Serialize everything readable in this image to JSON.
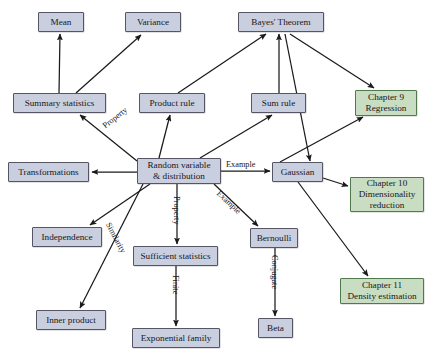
{
  "diagram": {
    "colors": {
      "concept_fill": "#c9cfdf",
      "concept_border": "#555566",
      "chapter_fill": "#c9ddc2",
      "chapter_border": "#4e7a4c",
      "edge": "#1a1a1a",
      "background": "#ffffff"
    },
    "nodes": [
      {
        "id": "mean",
        "label": "Mean",
        "type": "concept",
        "x": 38,
        "y": 12,
        "w": 46,
        "h": 20
      },
      {
        "id": "variance",
        "label": "Variance",
        "type": "concept",
        "x": 125,
        "y": 12,
        "w": 56,
        "h": 20
      },
      {
        "id": "bayes",
        "label": "Bayes' Theorem",
        "type": "concept",
        "x": 238,
        "y": 12,
        "w": 86,
        "h": 20
      },
      {
        "id": "summary_statistics",
        "label": "Summary statistics",
        "type": "concept",
        "x": 13,
        "y": 93,
        "w": 93,
        "h": 20
      },
      {
        "id": "product_rule",
        "label": "Product rule",
        "type": "concept",
        "x": 139,
        "y": 93,
        "w": 66,
        "h": 20
      },
      {
        "id": "sum_rule",
        "label": "Sum rule",
        "type": "concept",
        "x": 251,
        "y": 93,
        "w": 55,
        "h": 20
      },
      {
        "id": "chapter9",
        "label": "Chapter 9\nRegression",
        "type": "chapter",
        "x": 355,
        "y": 90,
        "w": 62,
        "h": 26
      },
      {
        "id": "transformations",
        "label": "Transformations",
        "type": "concept",
        "x": 8,
        "y": 162,
        "w": 81,
        "h": 20
      },
      {
        "id": "random_variable",
        "label": "Random variable\n& distribution",
        "type": "concept",
        "x": 137,
        "y": 158,
        "w": 84,
        "h": 26
      },
      {
        "id": "gaussian",
        "label": "Gaussian",
        "type": "concept",
        "x": 272,
        "y": 162,
        "w": 51,
        "h": 20
      },
      {
        "id": "chapter10",
        "label": "Chapter 10\nDimensionality\nreduction",
        "type": "chapter",
        "x": 350,
        "y": 177,
        "w": 74,
        "h": 35
      },
      {
        "id": "independence",
        "label": "Independence",
        "type": "concept",
        "x": 32,
        "y": 227,
        "w": 70,
        "h": 20
      },
      {
        "id": "sufficient_stats",
        "label": "Sufficient statistics",
        "type": "concept",
        "x": 133,
        "y": 246,
        "w": 85,
        "h": 20
      },
      {
        "id": "bernoulli",
        "label": "Bernoulli",
        "type": "concept",
        "x": 250,
        "y": 228,
        "w": 48,
        "h": 20
      },
      {
        "id": "chapter11",
        "label": "Chapter 11\nDensity estimation",
        "type": "chapter",
        "x": 340,
        "y": 278,
        "w": 84,
        "h": 26
      },
      {
        "id": "inner_product",
        "label": "Inner product",
        "type": "concept",
        "x": 36,
        "y": 310,
        "w": 70,
        "h": 20
      },
      {
        "id": "beta",
        "label": "Beta",
        "type": "concept",
        "x": 258,
        "y": 318,
        "w": 35,
        "h": 20
      },
      {
        "id": "exponential_family",
        "label": "Exponential family",
        "type": "concept",
        "x": 132,
        "y": 328,
        "w": 88,
        "h": 20
      }
    ],
    "edges": [
      {
        "id": "summary-to-mean",
        "from": "summary_statistics",
        "to": "mean",
        "x1": 59,
        "y1": 93,
        "x2": 60,
        "y2": 34,
        "label": ""
      },
      {
        "id": "summary-to-variance",
        "from": "summary_statistics",
        "to": "variance",
        "x1": 76,
        "y1": 93,
        "x2": 141,
        "y2": 35,
        "label": ""
      },
      {
        "id": "rv-to-summary",
        "from": "random_variable",
        "to": "summary_statistics",
        "x1": 137,
        "y1": 161,
        "x2": 80,
        "y2": 115,
        "label": "Property"
      },
      {
        "id": "rv-to-product-rule",
        "from": "random_variable",
        "to": "product_rule",
        "x1": 159,
        "y1": 158,
        "x2": 170,
        "y2": 115,
        "label": ""
      },
      {
        "id": "rv-to-sum-rule",
        "from": "random_variable",
        "to": "sum_rule",
        "x1": 200,
        "y1": 158,
        "x2": 272,
        "y2": 115,
        "label": ""
      },
      {
        "id": "product-rule-to-bayes",
        "from": "product_rule",
        "to": "bayes",
        "x1": 178,
        "y1": 93,
        "x2": 266,
        "y2": 34,
        "label": ""
      },
      {
        "id": "sum-rule-to-bayes",
        "from": "sum_rule",
        "to": "bayes",
        "x1": 279,
        "y1": 93,
        "x2": 279,
        "y2": 34,
        "label": ""
      },
      {
        "id": "bayes-to-chapter9",
        "from": "bayes",
        "to": "chapter9",
        "x1": 290,
        "y1": 34,
        "x2": 374,
        "y2": 88,
        "label": ""
      },
      {
        "id": "bayes-to-gaussian",
        "from": "bayes",
        "to": "gaussian",
        "x1": 285,
        "y1": 34,
        "x2": 310,
        "y2": 161,
        "label": ""
      },
      {
        "id": "rv-to-transformations",
        "from": "random_variable",
        "to": "transformations",
        "x1": 137,
        "y1": 172,
        "x2": 92,
        "y2": 172,
        "label": ""
      },
      {
        "id": "rv-to-gaussian",
        "from": "random_variable",
        "to": "gaussian",
        "x1": 221,
        "y1": 171,
        "x2": 270,
        "y2": 171,
        "label": "Example"
      },
      {
        "id": "rv-to-bernoulli",
        "from": "random_variable",
        "to": "bernoulli",
        "x1": 214,
        "y1": 184,
        "x2": 258,
        "y2": 226,
        "label": "Example"
      },
      {
        "id": "rv-to-independence",
        "from": "random_variable",
        "to": "independence",
        "x1": 150,
        "y1": 184,
        "x2": 90,
        "y2": 225,
        "label": ""
      },
      {
        "id": "rv-to-sufficient-stats",
        "from": "random_variable",
        "to": "sufficient_stats",
        "x1": 177,
        "y1": 184,
        "x2": 177,
        "y2": 244,
        "label": "Property"
      },
      {
        "id": "rv-to-inner-product",
        "from": "random_variable",
        "to": "inner_product",
        "x1": 143,
        "y1": 184,
        "x2": 80,
        "y2": 308,
        "label": "Similarity"
      },
      {
        "id": "gaussian-to-chapter9",
        "from": "gaussian",
        "to": "chapter9",
        "x1": 280,
        "y1": 162,
        "x2": 363,
        "y2": 117,
        "label": ""
      },
      {
        "id": "gaussian-to-chapter10",
        "from": "gaussian",
        "to": "chapter10",
        "x1": 323,
        "y1": 178,
        "x2": 348,
        "y2": 186,
        "label": ""
      },
      {
        "id": "gaussian-to-chapter11",
        "from": "gaussian",
        "to": "chapter11",
        "x1": 298,
        "y1": 182,
        "x2": 368,
        "y2": 276,
        "label": ""
      },
      {
        "id": "sufficient-to-exponential",
        "from": "sufficient_stats",
        "to": "exponential_family",
        "x1": 176,
        "y1": 266,
        "x2": 176,
        "y2": 326,
        "label": "Finite"
      },
      {
        "id": "bernoulli-to-beta",
        "from": "bernoulli",
        "to": "beta",
        "x1": 275,
        "y1": 248,
        "x2": 275,
        "y2": 316,
        "label": "Conjugate"
      }
    ],
    "edge_labels": [
      {
        "id": "label-property-summary",
        "text": "Property",
        "x": 101,
        "y": 123,
        "rotate": -38
      },
      {
        "id": "label-example-gaussian",
        "text": "Example",
        "x": 226,
        "y": 160,
        "rotate": 0
      },
      {
        "id": "label-example-bernoulli",
        "text": "Example",
        "x": 221,
        "y": 189,
        "rotate": 43
      },
      {
        "id": "label-property-sufficient",
        "text": "Property",
        "x": 181,
        "y": 196,
        "rotate": 90
      },
      {
        "id": "label-similarity",
        "text": "Similarity",
        "x": 112,
        "y": 221,
        "rotate": 62
      },
      {
        "id": "label-finite",
        "text": "Finite",
        "x": 180,
        "y": 275,
        "rotate": 90
      },
      {
        "id": "label-conjugate",
        "text": "Conjugate",
        "x": 279,
        "y": 255,
        "rotate": 90
      }
    ]
  }
}
